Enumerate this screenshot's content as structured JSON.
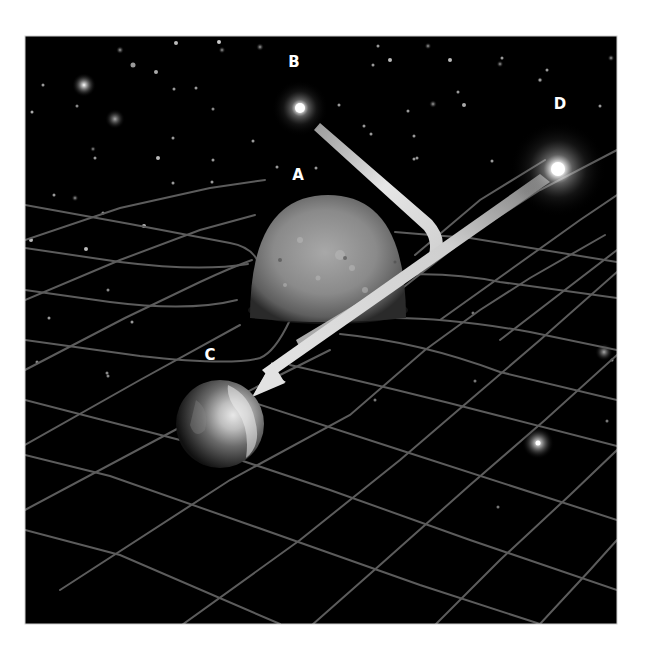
{
  "figure": {
    "labels": {
      "A": "A",
      "B": "B",
      "C": "C",
      "D": "D"
    },
    "colors": {
      "background": "#000000",
      "page": "#ffffff",
      "grid": "#5a5a5a",
      "ribbon": "#d8d8d8",
      "label": "#ffffff"
    }
  }
}
